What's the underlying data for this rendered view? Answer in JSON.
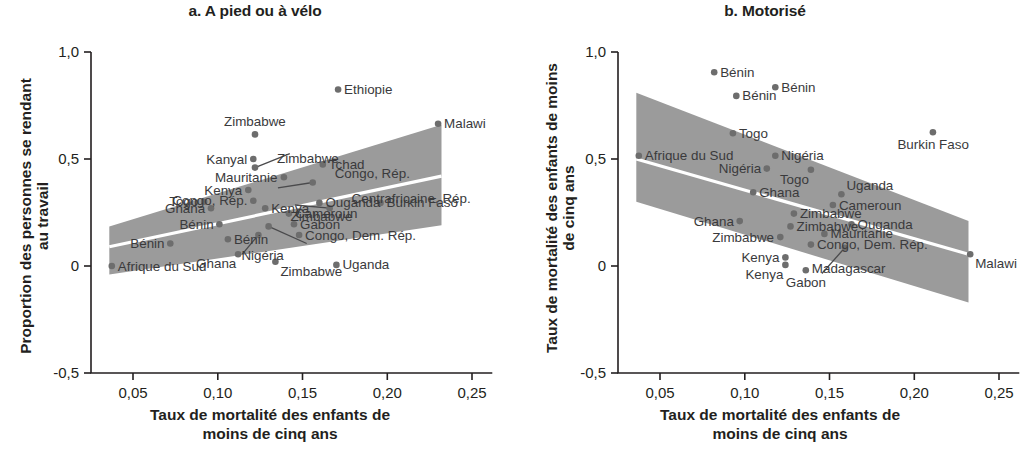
{
  "figure": {
    "panels": [
      {
        "id": "a",
        "title": "a. A pied ou à vélo",
        "ylabel_line1": "Proportion des personnes se rendant",
        "ylabel_line2": "au travail",
        "xlabel_line1": "Taux de mortalité des enfants de",
        "xlabel_line2": "moins de cinq ans"
      },
      {
        "id": "b",
        "title": "b. Motorisé",
        "ylabel_line1": "Taux de mortalité des enfants de moins",
        "ylabel_line2": "de cinq ans",
        "xlabel_line1": "Taux de mortalité des enfants de",
        "xlabel_line2": "moins de cinq ans"
      }
    ]
  },
  "chart_data": [
    {
      "type": "scatter",
      "panel": "a",
      "title": "a. A pied ou à vélo",
      "xlabel": "Taux de mortalité des enfants de moins de cinq ans",
      "ylabel": "Proportion des personnes se rendant au travail",
      "xlim": [
        0.033,
        0.262
      ],
      "ylim": [
        -0.55,
        1.08
      ],
      "xticks": [
        0.05,
        0.1,
        0.15,
        0.2,
        0.25
      ],
      "xticklabels": [
        "0,05",
        "0,10",
        "0,15",
        "0,20",
        "0,25"
      ],
      "yticks": [
        1.0,
        0.5,
        0.0,
        -0.5
      ],
      "yticklabels": [
        "1,0",
        "0,5",
        "0",
        "-0,5"
      ],
      "grid": false,
      "legend": false,
      "fit_line": {
        "x": [
          0.036,
          0.232
        ],
        "y": [
          0.09,
          0.42
        ],
        "style": "white-line-through-band"
      },
      "confidence_band": {
        "fill": "#9b9b9b",
        "x": [
          0.036,
          0.232
        ],
        "upper": [
          0.185,
          0.66
        ],
        "lower": [
          -0.04,
          0.19
        ]
      },
      "points": [
        {
          "label": "Afrique du Sud",
          "x": 0.0375,
          "y": 0.0,
          "label_pos": "right"
        },
        {
          "label": "Bénin",
          "x": 0.072,
          "y": 0.105,
          "label_pos": "left"
        },
        {
          "label": "Togo",
          "x": 0.092,
          "y": 0.3,
          "label_pos": "left"
        },
        {
          "label": "Ghana",
          "x": 0.096,
          "y": 0.27,
          "label_pos": "left"
        },
        {
          "label": "Bénin",
          "x": 0.101,
          "y": 0.195,
          "label_pos": "left"
        },
        {
          "label": "Bénin",
          "x": 0.106,
          "y": 0.125,
          "label_pos": "right"
        },
        {
          "label": "Ghana",
          "x": 0.112,
          "y": 0.055,
          "label_pos": "below-left"
        },
        {
          "label": "Kenya",
          "x": 0.118,
          "y": 0.355,
          "label_pos": "left"
        },
        {
          "label": "Congo, Rép.",
          "x": 0.121,
          "y": 0.305,
          "label_pos": "left"
        },
        {
          "label": "Kanyal",
          "x": 0.121,
          "y": 0.5,
          "label_pos": "left"
        },
        {
          "label": "Zimbabwe",
          "x": 0.122,
          "y": 0.615,
          "label_pos": "above"
        },
        {
          "label": "Zimbabwe",
          "x": 0.122,
          "y": 0.46,
          "label_pos": "leader-right"
        },
        {
          "label": "Kenya",
          "x": 0.128,
          "y": 0.27,
          "label_pos": "right"
        },
        {
          "label": "Nigéria",
          "x": 0.124,
          "y": 0.145,
          "label_pos": "leader-below"
        },
        {
          "label": "Zimbabwe",
          "x": 0.13,
          "y": 0.185,
          "label_pos": "leader-right"
        },
        {
          "label": "Zimbabwe",
          "x": 0.134,
          "y": 0.02,
          "label_pos": "below-right"
        },
        {
          "label": "Mauritanie",
          "x": 0.139,
          "y": 0.415,
          "label_pos": "left"
        },
        {
          "label": "Cameroun",
          "x": 0.142,
          "y": 0.245,
          "label_pos": "right"
        },
        {
          "label": "Gabon",
          "x": 0.145,
          "y": 0.195,
          "label_pos": "right"
        },
        {
          "label": "Congo, Dem. Rép.",
          "x": 0.148,
          "y": 0.145,
          "label_pos": "right"
        },
        {
          "label": "Congo, Rép.",
          "x": 0.156,
          "y": 0.39,
          "label_pos": "leader-right"
        },
        {
          "label": "Tchad",
          "x": 0.162,
          "y": 0.475,
          "label_pos": "right"
        },
        {
          "label": "Ouganda",
          "x": 0.16,
          "y": 0.295,
          "label_pos": "right"
        },
        {
          "label": "Uganda",
          "x": 0.17,
          "y": 0.005,
          "label_pos": "right"
        },
        {
          "label": "Ethiopie",
          "x": 0.171,
          "y": 0.825,
          "label_pos": "right"
        },
        {
          "label": "Centrafricaine, Rép.",
          "x": 0.166,
          "y": 0.27,
          "label_pos": "leader-right"
        },
        {
          "label": "Burkin Faso",
          "x": 0.196,
          "y": 0.295,
          "label_pos": "right"
        },
        {
          "label": "Malawi",
          "x": 0.23,
          "y": 0.665,
          "label_pos": "right"
        }
      ]
    },
    {
      "type": "scatter",
      "panel": "b",
      "title": "b. Motorisé",
      "xlabel": "Taux de mortalité des enfants de moins de cinq ans",
      "ylabel": "Taux de mortalité des enfants de moins de cinq ans",
      "xlim": [
        0.033,
        0.262
      ],
      "ylim": [
        -0.55,
        1.08
      ],
      "xticks": [
        0.05,
        0.1,
        0.15,
        0.2,
        0.25
      ],
      "xticklabels": [
        "0,05",
        "0,10",
        "0,15",
        "0,20",
        "0,25"
      ],
      "yticks": [
        1.0,
        0.5,
        0.0,
        -0.5
      ],
      "yticklabels": [
        "1,0",
        "0,5",
        "0",
        "-0,5"
      ],
      "grid": false,
      "legend": false,
      "fit_line": {
        "x": [
          0.036,
          0.232
        ],
        "y": [
          0.5,
          0.055
        ],
        "style": "white-line-through-band"
      },
      "confidence_band": {
        "fill": "#9b9b9b",
        "x": [
          0.036,
          0.232
        ],
        "upper": [
          0.81,
          0.21
        ],
        "lower": [
          0.3,
          -0.17
        ]
      },
      "points": [
        {
          "label": "Afrique du Sud",
          "x": 0.0375,
          "y": 0.515,
          "label_pos": "right"
        },
        {
          "label": "Bénin",
          "x": 0.082,
          "y": 0.905,
          "label_pos": "right"
        },
        {
          "label": "Bénin",
          "x": 0.095,
          "y": 0.795,
          "label_pos": "right"
        },
        {
          "label": "Bénin",
          "x": 0.118,
          "y": 0.835,
          "label_pos": "right"
        },
        {
          "label": "Togo",
          "x": 0.093,
          "y": 0.62,
          "label_pos": "right"
        },
        {
          "label": "Nigéria",
          "x": 0.118,
          "y": 0.515,
          "label_pos": "right"
        },
        {
          "label": "Nigéria",
          "x": 0.113,
          "y": 0.455,
          "label_pos": "left"
        },
        {
          "label": "Ghana",
          "x": 0.105,
          "y": 0.345,
          "label_pos": "right"
        },
        {
          "label": "Ghana",
          "x": 0.097,
          "y": 0.21,
          "label_pos": "left"
        },
        {
          "label": "Togo",
          "x": 0.139,
          "y": 0.45,
          "label_pos": "below-left"
        },
        {
          "label": "Uganda",
          "x": 0.157,
          "y": 0.335,
          "label_pos": "above-right"
        },
        {
          "label": "Cameroun",
          "x": 0.152,
          "y": 0.285,
          "label_pos": "right"
        },
        {
          "label": "Zimbabwe",
          "x": 0.129,
          "y": 0.245,
          "label_pos": "right"
        },
        {
          "label": "Zimbabwe",
          "x": 0.127,
          "y": 0.185,
          "label_pos": "right"
        },
        {
          "label": "Zimbabwe",
          "x": 0.121,
          "y": 0.135,
          "label_pos": "left"
        },
        {
          "label": "Ouganda",
          "x": 0.163,
          "y": 0.195,
          "label_pos": "right"
        },
        {
          "label": "Mauritanie",
          "x": 0.147,
          "y": 0.15,
          "label_pos": "right"
        },
        {
          "label": "Congo, Dem. Rép.",
          "x": 0.139,
          "y": 0.1,
          "label_pos": "right"
        },
        {
          "label": "Kenya",
          "x": 0.124,
          "y": 0.04,
          "label_pos": "left"
        },
        {
          "label": "Kenya",
          "x": 0.124,
          "y": 0.005,
          "label_pos": "below-left"
        },
        {
          "label": "Gabon",
          "x": 0.136,
          "y": -0.02,
          "label_pos": "below"
        },
        {
          "label": "Madagascar",
          "x": 0.159,
          "y": 0.085,
          "label_pos": "leader-below"
        },
        {
          "label": "Burkin Faso",
          "x": 0.211,
          "y": 0.625,
          "label_pos": "below"
        },
        {
          "label": "Malawi",
          "x": 0.233,
          "y": 0.055,
          "label_pos": "below-right"
        }
      ]
    }
  ],
  "colors": {
    "point": "#6d6d6d",
    "band": "#9b9b9b",
    "axis": "#231f20",
    "text": "#231f20",
    "label_text": "#3a3a3c"
  }
}
